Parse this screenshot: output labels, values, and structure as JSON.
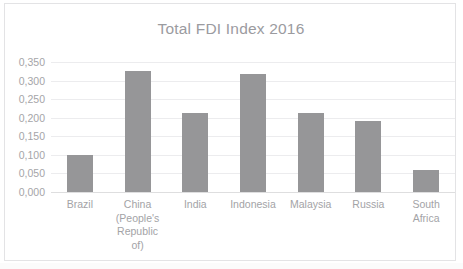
{
  "chart_data": {
    "type": "bar",
    "title": "Total FDI Index 2016",
    "xlabel": "",
    "ylabel": "",
    "categories": [
      "Brazil",
      "China (People's Republic of)",
      "India",
      "Indonesia",
      "Malaysia",
      "Russia",
      "South Africa"
    ],
    "category_lines": [
      [
        "Brazil"
      ],
      [
        "China",
        "(People's",
        "Republic",
        "of)"
      ],
      [
        "India"
      ],
      [
        "Indonesia"
      ],
      [
        "Malaysia"
      ],
      [
        "Russia"
      ],
      [
        "South",
        "Africa"
      ]
    ],
    "values": [
      0.1,
      0.327,
      0.213,
      0.318,
      0.213,
      0.192,
      0.058
    ],
    "ylim": [
      0.0,
      0.35
    ],
    "ytick_values": [
      0.35,
      0.3,
      0.25,
      0.2,
      0.15,
      0.1,
      0.05,
      0.0
    ],
    "ytick_labels": [
      "0,350",
      "0,300",
      "0,250",
      "0,200",
      "0,150",
      "0,100",
      "0,050",
      "0,000"
    ],
    "grid": true,
    "legend": false,
    "legend_position": "none",
    "decimal_separator": ",",
    "bar_color": "#969698",
    "gridline_color": "#ececee",
    "axis_text_color": "#a5a5a8",
    "title_color": "#9b9b9f",
    "border_color": "#e3e3e5",
    "background_color": "#ffffff"
  }
}
